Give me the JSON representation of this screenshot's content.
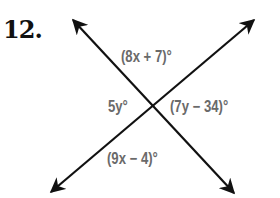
{
  "problem": {
    "number": "12."
  },
  "diagram": {
    "type": "intersecting-lines",
    "line_color": "#111111",
    "label_color": "#6a6a6a",
    "lines": [
      {
        "name": "line-a",
        "from": [
          73,
          20
        ],
        "to": [
          234,
          193
        ],
        "arrows": "both"
      },
      {
        "name": "line-b",
        "from": [
          51,
          192
        ],
        "to": [
          254,
          20
        ],
        "arrows": "both"
      }
    ],
    "angles": {
      "top": "(8x + 7)°",
      "left": "5y°",
      "right": "(7y − 34)°",
      "bottom": "(9x − 4)°"
    }
  }
}
